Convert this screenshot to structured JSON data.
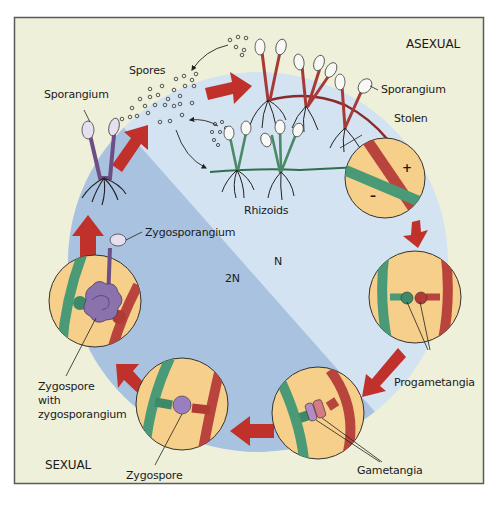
{
  "figure": {
    "type": "life-cycle-diagram",
    "colors": {
      "frame_background": "#eef0da",
      "frame_border": "#555555",
      "haploid_region": "#d3e3f1",
      "diploid_region": "#a9c2e0",
      "arrow": "#c0312b",
      "inset_fill": "#f6cf8a",
      "plus_strain": "#b9443e",
      "minus_strain": "#4a9a77",
      "zygospore": "#8b73ad"
    },
    "phase_labels": {
      "asexual": "ASEXUAL",
      "sexual": "SEXUAL",
      "haploid": "N",
      "diploid": "2N"
    },
    "labels": {
      "spores": "Spores",
      "sporangium_left": "Sporangium",
      "sporangium_right": "Sporangium",
      "stolen": "Stolen",
      "rhizoids": "Rhizoids",
      "zygosporangium": "Zygosporangium",
      "zygospore_with_zygosporangium_line1": "Zygospore",
      "zygospore_with_zygosporangium_line2": "with",
      "zygospore_with_zygosporangium_line3": "zygosporangium",
      "zygospore": "Zygospore",
      "gametangia": "Gametangia",
      "progametangia": "Progametangia"
    },
    "mating_signs": {
      "plus": "+",
      "minus": "–"
    },
    "stages": [
      {
        "id": "spore-release",
        "label": "Spores"
      },
      {
        "id": "hyphae-with-sporangia",
        "label": "Sporangium"
      },
      {
        "id": "stolon-mating-types",
        "label": "Stolen"
      },
      {
        "id": "progametangia-formation",
        "label": "Progametangia"
      },
      {
        "id": "gametangia-fusion",
        "label": "Gametangia"
      },
      {
        "id": "zygospore-formation",
        "label": "Zygospore"
      },
      {
        "id": "zygospore-germination",
        "label": "Zygospore with zygosporangium"
      },
      {
        "id": "zygosporangium-release",
        "label": "Zygosporangium"
      }
    ]
  }
}
